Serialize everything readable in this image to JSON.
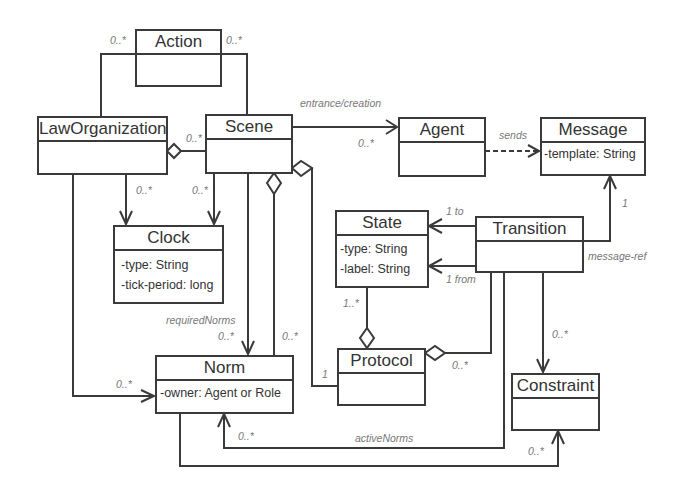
{
  "diagram": {
    "type": "uml-class-diagram",
    "classes": {
      "action": {
        "name": "Action",
        "attributes": []
      },
      "law_organization": {
        "name": "LawOrganization",
        "attributes": []
      },
      "scene": {
        "name": "Scene",
        "attributes": []
      },
      "agent": {
        "name": "Agent",
        "attributes": []
      },
      "message": {
        "name": "Message",
        "attributes": [
          "-template: String"
        ]
      },
      "clock": {
        "name": "Clock",
        "attributes": [
          "-type: String",
          "-tick-period: long"
        ]
      },
      "state": {
        "name": "State",
        "attributes": [
          "-type: String",
          "-label: String"
        ]
      },
      "transition": {
        "name": "Transition",
        "attributes": []
      },
      "norm": {
        "name": "Norm",
        "attributes": [
          "-owner: Agent or Role"
        ]
      },
      "protocol": {
        "name": "Protocol",
        "attributes": []
      },
      "constraint": {
        "name": "Constraint",
        "attributes": []
      }
    },
    "labels": {
      "action_lo_mult": "0..*",
      "action_scene_mult": "0..*",
      "lo_scene_mult": "0..*",
      "entrance_creation": "entrance/creation",
      "scene_agent_mult": "0..*",
      "sends": "sends",
      "lo_clock_mult": "0..*",
      "scene_clock_mult": "0..*",
      "to_label": "1 to",
      "from_label": "1 from",
      "message_ref_mult": "1",
      "message_ref": "message-ref",
      "state_protocol_mult": "1..*",
      "required_norms": "requiredNorms",
      "required_norms_mult": "0..*",
      "scene_norm_mult": "0..*",
      "scene_protocol_mult": "1",
      "protocol_transition_mult": "0..*",
      "transition_constraint_mult": "0..*",
      "lo_norm_mult": "0..*",
      "active_norms": "activeNorms",
      "active_norms_mult": "0..*",
      "norm_constraint_mult": "0..*"
    },
    "colors": {
      "line": "#3a3a3a",
      "label": "#777777",
      "text": "#333333"
    }
  }
}
